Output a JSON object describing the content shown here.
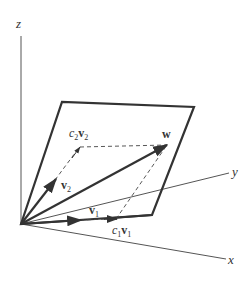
{
  "diagram": {
    "axes": {
      "z_label": "z",
      "y_label": "y",
      "x_label": "x"
    },
    "vectors": {
      "v1_label": "v",
      "v1_sub": "1",
      "v2_label": "v",
      "v2_sub": "2",
      "w_label": "w"
    },
    "scaled_vectors": {
      "c1v1_coef": "c",
      "c1v1_coef_sub": "1",
      "c1v1_vec": "v",
      "c1v1_vec_sub": "1",
      "c2v2_coef": "c",
      "c2v2_coef_sub": "2",
      "c2v2_vec": "v",
      "c2v2_vec_sub": "2"
    },
    "colors": {
      "background": "#ffffff",
      "stroke": "#333333",
      "axis": "#555555"
    }
  }
}
